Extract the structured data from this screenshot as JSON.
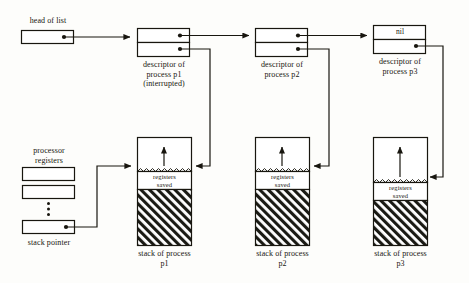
{
  "diagram": {
    "colors": {
      "ink": "#18160f",
      "background": "#fdfdfb",
      "hatch": "#1a1a14"
    },
    "head": {
      "label": "head of list",
      "pointer_marker": "filled-dot"
    },
    "registers": {
      "label_line1": "processor",
      "label_line2": "registers",
      "stack_pointer_label": "stack pointer",
      "ellipsis_marker": "vertical-dots",
      "slots": [
        "",
        "",
        ""
      ]
    },
    "descriptors": [
      {
        "id": "p1",
        "top_cell_text": "",
        "bottom_cell_text": "",
        "caption_lines": [
          "descriptor of",
          "process p1",
          "(interrupted)"
        ]
      },
      {
        "id": "p2",
        "top_cell_text": "",
        "bottom_cell_text": "",
        "caption_lines": [
          "descriptor of",
          "process p2"
        ]
      },
      {
        "id": "p3",
        "top_cell_text": "nil",
        "bottom_cell_text": "",
        "caption_lines": [
          "descriptor of",
          "process p3"
        ]
      }
    ],
    "stacks": [
      {
        "id": "p1",
        "saved_label_line1": "registers",
        "saved_label_line2": "saved",
        "caption_lines": [
          "stack of process",
          "p1"
        ],
        "growth_arrow": "up-arrow"
      },
      {
        "id": "p2",
        "saved_label_line1": "registers",
        "saved_label_line2": "saved",
        "caption_lines": [
          "stack of process",
          "p2"
        ],
        "growth_arrow": "up-arrow"
      },
      {
        "id": "p3",
        "saved_label_line1": "registers",
        "saved_label_line2": "saved",
        "caption_lines": [
          "stack of process",
          "p3"
        ],
        "growth_arrow": "up-arrow"
      }
    ]
  }
}
